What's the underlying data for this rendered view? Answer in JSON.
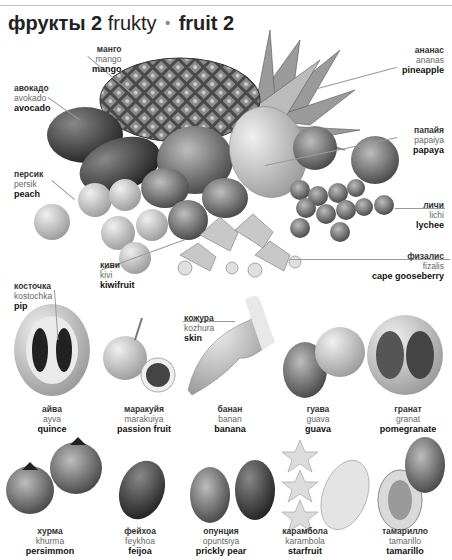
{
  "page": {
    "running_head": "дe ... фрукты",
    "title": {
      "russian": "фрукты 2",
      "transliteration": "frukty",
      "separator": "•",
      "english": "fruit 2"
    }
  },
  "main_group": {
    "labels": [
      {
        "id": "mango",
        "ru": "манго",
        "tl": "mango",
        "en": "mango"
      },
      {
        "id": "avocado",
        "ru": "авокадо",
        "tl": "avokado",
        "en": "avocado"
      },
      {
        "id": "peach",
        "ru": "персик",
        "tl": "persik",
        "en": "peach"
      },
      {
        "id": "kiwifruit",
        "ru": "киви",
        "tl": "kivi",
        "en": "kiwifruit"
      },
      {
        "id": "pineapple",
        "ru": "ананас",
        "tl": "ananas",
        "en": "pineapple"
      },
      {
        "id": "papaya",
        "ru": "папайя",
        "tl": "papaiya",
        "en": "papaya"
      },
      {
        "id": "lychee",
        "ru": "личи",
        "tl": "lichi",
        "en": "lychee"
      },
      {
        "id": "cape-gooseberry",
        "ru": "физалис",
        "tl": "fizalis",
        "en": "cape gooseberry"
      }
    ]
  },
  "annotations": {
    "pip": {
      "ru": "косточка",
      "tl": "kostochka",
      "en": "pip"
    },
    "skin": {
      "ru": "кожура",
      "tl": "kozhura",
      "en": "skin"
    }
  },
  "row1": [
    {
      "id": "quince",
      "ru": "айва",
      "tl": "ayva",
      "en": "quince"
    },
    {
      "id": "passion-fruit",
      "ru": "маракуйя",
      "tl": "marakuiya",
      "en": "passion fruit"
    },
    {
      "id": "banana",
      "ru": "банан",
      "tl": "banan",
      "en": "banana"
    },
    {
      "id": "guava",
      "ru": "гуава",
      "tl": "guava",
      "en": "guava"
    },
    {
      "id": "pomegranate",
      "ru": "гранат",
      "tl": "granat",
      "en": "pomegranate"
    }
  ],
  "row2": [
    {
      "id": "persimmon",
      "ru": "хурма",
      "tl": "khurma",
      "en": "persimmon"
    },
    {
      "id": "feijoa",
      "ru": "фейхоа",
      "tl": "feykhoa",
      "en": "feijoa"
    },
    {
      "id": "prickly-pear",
      "ru": "опунция",
      "tl": "opuntsiya",
      "en": "prickly pear"
    },
    {
      "id": "starfruit",
      "ru": "карамбола",
      "tl": "karambola",
      "en": "starfruit"
    },
    {
      "id": "tamarillo",
      "ru": "тамарилло",
      "tl": "tamarillo",
      "en": "tamarillo"
    }
  ],
  "colors": {
    "text": "#222222",
    "transliteration": "#666666",
    "leader_line": "#9a9a9a",
    "background": "#ffffff"
  }
}
